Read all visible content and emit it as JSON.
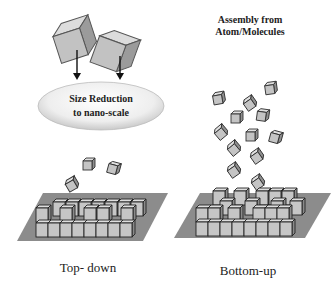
{
  "diagram": {
    "left_panel": {
      "ellipse_label_line1": "Size Reduction",
      "ellipse_label_line2": "to nano-scale",
      "caption": "Top- down"
    },
    "right_panel": {
      "title_line1": "Assembly from",
      "title_line2": "Atom/Molecules",
      "caption": "Bottom-up"
    },
    "colors": {
      "cube_face": "#c8c8c8",
      "cube_top": "#e2e2e2",
      "cube_side": "#9a9a9a",
      "cube_stroke": "#333333",
      "platform": "#8c8c8c",
      "ellipse_fill": "#ececec",
      "text": "#222222"
    }
  }
}
